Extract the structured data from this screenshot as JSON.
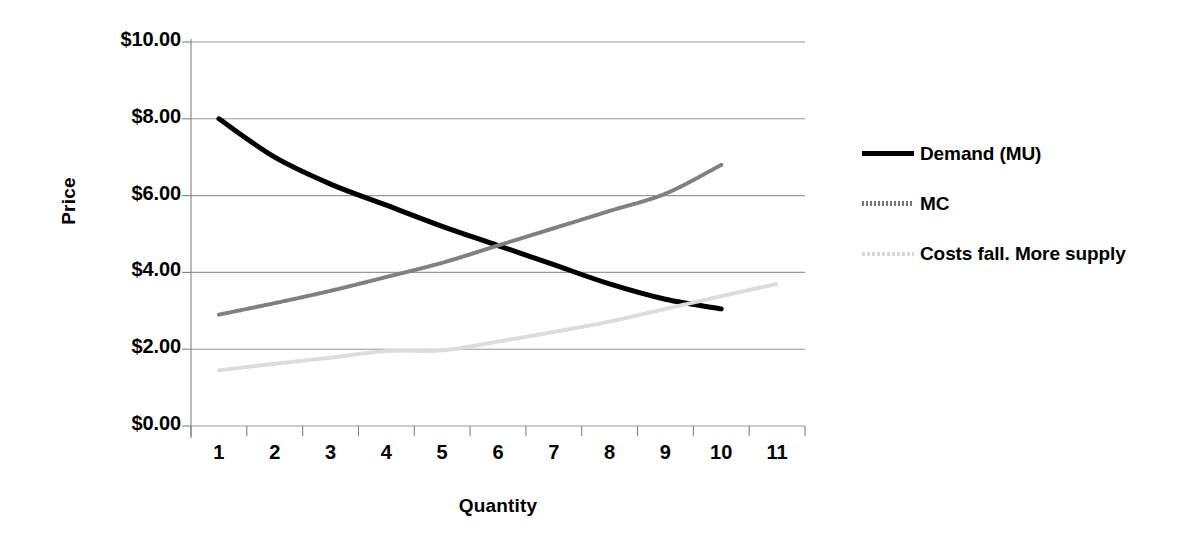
{
  "chart_data": {
    "type": "line",
    "title": "",
    "xlabel": "Quantity",
    "ylabel": "Price",
    "categories": [
      "1",
      "2",
      "3",
      "4",
      "5",
      "6",
      "7",
      "8",
      "9",
      "10",
      "11"
    ],
    "x": [
      1,
      2,
      3,
      4,
      5,
      6,
      7,
      8,
      9,
      10,
      11
    ],
    "ylim": [
      0,
      10
    ],
    "yticks": [
      0,
      2,
      4,
      6,
      8,
      10
    ],
    "ytick_labels": [
      "$0.00",
      "$2.00",
      "$4.00",
      "$6.00",
      "$8.00",
      "$10.00"
    ],
    "grid": "horizontal",
    "legend_position": "right",
    "series": [
      {
        "name": "Demand (MU)",
        "style": "solid",
        "color": "#000000",
        "width": 5,
        "values": [
          8.0,
          7.0,
          6.3,
          5.75,
          5.2,
          4.7,
          4.2,
          3.7,
          3.3,
          3.05,
          null
        ]
      },
      {
        "name": "MC",
        "style": "dotted",
        "color": "#808080",
        "width": 4,
        "values": [
          2.9,
          3.2,
          3.52,
          3.88,
          4.25,
          4.7,
          5.15,
          5.6,
          6.05,
          6.8,
          null
        ]
      },
      {
        "name": "Costs fall. More supply",
        "style": "dotted-light",
        "color": "#dcdcdc",
        "width": 4,
        "values": [
          1.45,
          1.62,
          1.78,
          1.95,
          1.97,
          2.2,
          2.45,
          2.72,
          3.05,
          3.38,
          3.7
        ]
      }
    ]
  },
  "legend": {
    "items": [
      {
        "label": "Demand (MU)"
      },
      {
        "label": "MC"
      },
      {
        "label": "Costs fall. More supply"
      }
    ]
  },
  "colors": {
    "demand": "#000000",
    "mc": "#808080",
    "costs_fall": "#dcdcdc",
    "gridline": "#999999",
    "axis": "#808080",
    "background": "#ffffff"
  }
}
